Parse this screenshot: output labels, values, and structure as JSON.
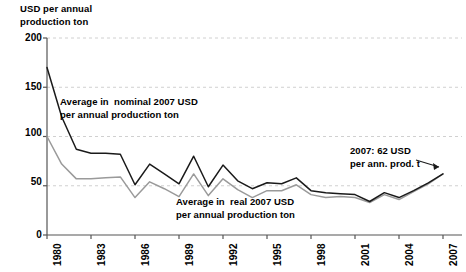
{
  "chart_data": {
    "type": "line",
    "title": "",
    "subtitle": "",
    "ylabel": "USD per annual\nproduction ton",
    "xlabel": "",
    "ylim": [
      0,
      200
    ],
    "yticks": [
      0,
      50,
      100,
      150,
      200
    ],
    "xticks": [
      "1980",
      "1983",
      "1986",
      "1989",
      "1992",
      "1995",
      "1998",
      "2001",
      "2004",
      "2007"
    ],
    "grid": true,
    "legend_position": "inline-annotations",
    "x": [
      1980,
      1981,
      1982,
      1983,
      1984,
      1985,
      1986,
      1987,
      1988,
      1989,
      1990,
      1991,
      1992,
      1993,
      1994,
      1995,
      1996,
      1997,
      1998,
      1999,
      2000,
      2001,
      2002,
      2003,
      2004,
      2005,
      2006,
      2007
    ],
    "series": [
      {
        "name": "Average in  nominal 2007 USD per annual production ton",
        "color": "#1a1a1a",
        "values": [
          170,
          120,
          87,
          83,
          83,
          82,
          51,
          72,
          62,
          52,
          80,
          49,
          71,
          55,
          47,
          53,
          52,
          58,
          45,
          43,
          42,
          41,
          34,
          43,
          38,
          45,
          53,
          62
        ]
      },
      {
        "name": "Average in  real 2007 USD per annual production ton",
        "color": "#9a9a9a",
        "values": [
          100,
          72,
          57,
          57,
          58,
          59,
          38,
          54,
          47,
          39,
          62,
          40,
          57,
          46,
          38,
          45,
          45,
          51,
          41,
          38,
          39,
          38,
          33,
          41,
          36,
          44,
          52,
          62
        ]
      }
    ],
    "annotations": [
      {
        "id": "nominal",
        "line1": "Average in  nominal 2007 USD",
        "line2": "per annual production ton"
      },
      {
        "id": "real",
        "line1": "Average in  real 2007 USD",
        "line2": "per annual production ton"
      },
      {
        "id": "callout",
        "line1": "2007: 62 USD",
        "line2": "per ann. prod. t",
        "value": 62,
        "year": 2007
      }
    ]
  },
  "axis": {
    "y_title_line1": "USD per annual",
    "y_title_line2": "production ton",
    "ytick_0": "0",
    "ytick_50": "50",
    "ytick_100": "100",
    "ytick_150": "150",
    "ytick_200": "200",
    "xtick_0": "1980",
    "xtick_1": "1983",
    "xtick_2": "1986",
    "xtick_3": "1989",
    "xtick_4": "1992",
    "xtick_5": "1995",
    "xtick_6": "1998",
    "xtick_7": "2001",
    "xtick_8": "2004",
    "xtick_9": "2007"
  },
  "colors": {
    "nominal_line": "#1a1a1a",
    "real_line": "#9a9a9a",
    "grid": "#d0d0d0",
    "axis": "#555555",
    "background": "#ffffff"
  }
}
